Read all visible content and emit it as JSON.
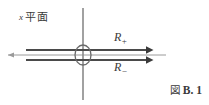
{
  "figure": {
    "caption_prefix": "図",
    "caption_id": "B. 1",
    "plane_label_variable": "x",
    "plane_label_text": "平面",
    "ray_upper_symbol": "R",
    "ray_upper_subscript": "+",
    "ray_lower_symbol": "R",
    "ray_lower_subscript": "−",
    "ink_color": "#4a4a4a",
    "axis_color": "#8a8a8a",
    "background_color": "#ffffff"
  },
  "geometry": {
    "origin_x": 83,
    "origin_y": 55,
    "vertical_axis_top": 8,
    "vertical_axis_bottom": 100,
    "horizontal_axis_left": 8,
    "horizontal_axis_right": 166,
    "ray_upper_y": 50,
    "ray_lower_y": 60,
    "ray_start_x": 26,
    "ray_arrow_x": 148,
    "ellipse_rx": 8,
    "ellipse_ry": 10
  }
}
